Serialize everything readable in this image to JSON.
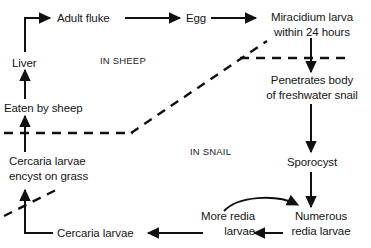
{
  "diagram": {
    "stroke_color": "#111111",
    "text_color": "#161616",
    "background_color": "#ffffff",
    "nodes": [
      {
        "id": "adult_fluke",
        "label": "Adult fluke"
      },
      {
        "id": "egg",
        "label": "Egg"
      },
      {
        "id": "miracidium",
        "line1": "Miracidium larva",
        "line2": "within 24 hours"
      },
      {
        "id": "liver",
        "label": "Liver"
      },
      {
        "id": "eaten_by_sheep",
        "label": "Eaten by sheep"
      },
      {
        "id": "penetrates",
        "line1": "Penetrates body",
        "line2": "of freshwater snail"
      },
      {
        "id": "cercaria_encyst",
        "line1": "Cercaria larvae",
        "line2": "encyst on grass"
      },
      {
        "id": "sporocyst",
        "label": "Sporocyst"
      },
      {
        "id": "numerous_redia",
        "line1": "Numerous",
        "line2": "redia larvae"
      },
      {
        "id": "more_redia",
        "line1": "More redia",
        "line2": "larvae"
      },
      {
        "id": "cercaria_larvae",
        "label": "Cercaria larvae"
      }
    ],
    "regions": [
      {
        "id": "in_sheep",
        "label": "IN SHEEP"
      },
      {
        "id": "in_snail",
        "label": "IN SNAIL"
      }
    ]
  }
}
